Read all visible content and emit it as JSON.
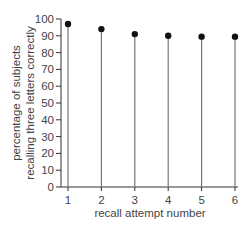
{
  "chart_data": {
    "type": "scatter",
    "style": "stem (lollipop) plot",
    "title": "",
    "xlabel": "recall attempt number",
    "ylabel_lines": [
      "percentage of subjects",
      "recalling three letters correctly"
    ],
    "ylabel": "percentage of subjects recalling three letters correctly",
    "x": [
      1,
      2,
      3,
      4,
      5,
      6
    ],
    "values": [
      97,
      94,
      91,
      90,
      89.5,
      89.5
    ],
    "xticks": [
      "1",
      "2",
      "3",
      "4",
      "5",
      "6"
    ],
    "yticks": [
      "0",
      "10",
      "20",
      "30",
      "40",
      "50",
      "60",
      "70",
      "80",
      "90",
      "100"
    ],
    "xlim": [
      0.8,
      6.1
    ],
    "ylim": [
      0,
      100
    ],
    "grid": false,
    "legend": null,
    "colors": {
      "marker": "#111111",
      "stem": "#777777",
      "axis": "#333333",
      "text": "#444444"
    }
  }
}
